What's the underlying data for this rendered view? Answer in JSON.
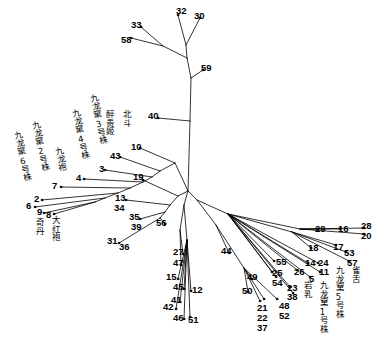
{
  "figure": {
    "type": "phylogenetic-tree",
    "layout": "unrooted-radial",
    "background_color": "#ffffff",
    "line_color": "#000000",
    "text_color": "#000000"
  },
  "chart_data": {
    "type": "scatter",
    "title": "",
    "xlabel": "",
    "ylabel": "",
    "grid": false,
    "legend": null,
    "tree_layout": "unrooted",
    "leaf_count": 59,
    "leaves": [
      {
        "id": "32",
        "label": "32",
        "x": 178,
        "y": 12
      },
      {
        "id": "30",
        "label": "30",
        "x": 201,
        "y": 15
      },
      {
        "id": "33",
        "label": "33",
        "x": 140,
        "y": 25
      },
      {
        "id": "58",
        "label": "58",
        "x": 130,
        "y": 39
      },
      {
        "id": "59",
        "label": "59",
        "x": 205,
        "y": 68
      },
      {
        "id": "40",
        "label": "40",
        "x": 155,
        "y": 116
      },
      {
        "id": "10",
        "label": "10",
        "x": 138,
        "y": 146,
        "name": "北斗"
      },
      {
        "id": "43",
        "label": "43",
        "x": 118,
        "y": 155,
        "name": "醉贵姬"
      },
      {
        "id": "3",
        "label": "3",
        "x": 103,
        "y": 168,
        "name": "九龙窠3号株"
      },
      {
        "id": "4",
        "label": "4",
        "x": 82,
        "y": 177,
        "name": "九龙窠4号株"
      },
      {
        "id": "7",
        "label": "7",
        "x": 59,
        "y": 185,
        "name": "九龙袍"
      },
      {
        "id": "2",
        "label": "2",
        "x": 40,
        "y": 198,
        "name": "九龙窠2号株"
      },
      {
        "id": "6",
        "label": "6",
        "x": 33,
        "y": 205,
        "name": "九龙窠6号株"
      },
      {
        "id": "9",
        "label": "9",
        "x": 42,
        "y": 212,
        "name": "奇丹"
      },
      {
        "id": "8",
        "label": "8",
        "x": 52,
        "y": 213,
        "name": "大红袍"
      },
      {
        "id": "19",
        "label": "19",
        "x": 140,
        "y": 177
      },
      {
        "id": "13",
        "label": "13",
        "x": 123,
        "y": 198
      },
      {
        "id": "34",
        "label": "34",
        "x": 122,
        "y": 208
      },
      {
        "id": "35",
        "label": "35",
        "x": 137,
        "y": 217
      },
      {
        "id": "39",
        "label": "39",
        "x": 138,
        "y": 227
      },
      {
        "id": "56",
        "label": "56",
        "x": 163,
        "y": 222
      },
      {
        "id": "31",
        "label": "31",
        "x": 115,
        "y": 241
      },
      {
        "id": "36",
        "label": "36",
        "x": 127,
        "y": 246
      },
      {
        "id": "27",
        "label": "27",
        "x": 180,
        "y": 252
      },
      {
        "id": "47",
        "label": "47",
        "x": 180,
        "y": 263
      },
      {
        "id": "15",
        "label": "15",
        "x": 173,
        "y": 277
      },
      {
        "id": "45",
        "label": "45",
        "x": 180,
        "y": 287
      },
      {
        "id": "12",
        "label": "12",
        "x": 199,
        "y": 289
      },
      {
        "id": "41",
        "label": "41",
        "x": 178,
        "y": 300
      },
      {
        "id": "42",
        "label": "42",
        "x": 170,
        "y": 307
      },
      {
        "id": "46",
        "label": "46",
        "x": 180,
        "y": 317
      },
      {
        "id": "51",
        "label": "51",
        "x": 194,
        "y": 319
      },
      {
        "id": "44",
        "label": "44",
        "x": 228,
        "y": 251
      },
      {
        "id": "49",
        "label": "49",
        "x": 254,
        "y": 277
      },
      {
        "id": "50",
        "label": "50",
        "x": 249,
        "y": 290
      },
      {
        "id": "21",
        "label": "21",
        "x": 264,
        "y": 307
      },
      {
        "id": "22",
        "label": "22",
        "x": 264,
        "y": 317
      },
      {
        "id": "37",
        "label": "37",
        "x": 264,
        "y": 327
      },
      {
        "id": "48",
        "label": "48",
        "x": 285,
        "y": 305
      },
      {
        "id": "52",
        "label": "52",
        "x": 285,
        "y": 315
      },
      {
        "id": "55",
        "label": "55",
        "x": 282,
        "y": 262
      },
      {
        "id": "25",
        "label": "25",
        "x": 278,
        "y": 273
      },
      {
        "id": "54",
        "label": "54",
        "x": 278,
        "y": 282
      },
      {
        "id": "23",
        "label": "23",
        "x": 293,
        "y": 287
      },
      {
        "id": "38",
        "label": "38",
        "x": 293,
        "y": 296
      },
      {
        "id": "26",
        "label": "26",
        "x": 300,
        "y": 271
      },
      {
        "id": "14",
        "label": "14",
        "x": 312,
        "y": 262
      },
      {
        "id": "24",
        "label": "24",
        "x": 325,
        "y": 262
      },
      {
        "id": "11",
        "label": "11",
        "x": 325,
        "y": 271
      },
      {
        "id": "5",
        "label": "5",
        "x": 313,
        "y": 278,
        "name": "九龙窠1号株"
      },
      {
        "id": "18",
        "label": "18",
        "x": 315,
        "y": 247
      },
      {
        "id": "17",
        "label": "17",
        "x": 340,
        "y": 246
      },
      {
        "id": "53",
        "label": "53",
        "x": 350,
        "y": 252
      },
      {
        "id": "57",
        "label": "57",
        "x": 353,
        "y": 262
      },
      {
        "id": "29",
        "label": "29",
        "x": 322,
        "y": 228
      },
      {
        "id": "16",
        "label": "16",
        "x": 344,
        "y": 228
      },
      {
        "id": "28",
        "label": "28",
        "x": 367,
        "y": 226
      },
      {
        "id": "20",
        "label": "20",
        "x": 367,
        "y": 235
      }
    ],
    "named_taxa": [
      {
        "number": "10",
        "name": "北斗"
      },
      {
        "number": "43",
        "name": "醉贵姬"
      },
      {
        "number": "3",
        "name": "九龙窠3号株"
      },
      {
        "number": "4",
        "name": "九龙窠4号株"
      },
      {
        "number": "7",
        "name": "九龙袍"
      },
      {
        "number": "2",
        "name": "九龙窠2号株"
      },
      {
        "number": "6",
        "name": "九龙窠6号株"
      },
      {
        "number": "9",
        "name": "奇丹"
      },
      {
        "number": "8",
        "name": "大红袍"
      },
      {
        "number": "5",
        "name": "九龙窠1号株"
      },
      {
        "number": "11",
        "name": "九龙窠5号株"
      },
      {
        "number": "24",
        "name": "雀舌"
      },
      {
        "number": "23",
        "name": "岩乳"
      }
    ]
  },
  "labels": {
    "numbers": [
      {
        "id": "n32",
        "text": "32",
        "x": 176,
        "y": 6
      },
      {
        "id": "n30",
        "text": "30",
        "x": 194,
        "y": 11
      },
      {
        "id": "n33",
        "text": "33",
        "x": 131,
        "y": 20
      },
      {
        "id": "n58",
        "text": "58",
        "x": 121,
        "y": 35
      },
      {
        "id": "n59",
        "text": "59",
        "x": 201,
        "y": 63
      },
      {
        "id": "n40",
        "text": "40",
        "x": 148,
        "y": 111
      },
      {
        "id": "n10",
        "text": "10",
        "x": 131,
        "y": 142
      },
      {
        "id": "n43",
        "text": "43",
        "x": 110,
        "y": 151
      },
      {
        "id": "n3",
        "text": "3",
        "x": 99,
        "y": 164
      },
      {
        "id": "n4",
        "text": "4",
        "x": 76,
        "y": 173
      },
      {
        "id": "n7",
        "text": "7",
        "x": 52,
        "y": 181
      },
      {
        "id": "n2",
        "text": "2",
        "x": 34,
        "y": 194
      },
      {
        "id": "n6",
        "text": "6",
        "x": 26,
        "y": 201
      },
      {
        "id": "n9",
        "text": "9",
        "x": 37,
        "y": 207
      },
      {
        "id": "n8",
        "text": "8",
        "x": 46,
        "y": 210
      },
      {
        "id": "n19",
        "text": "19",
        "x": 133,
        "y": 172
      },
      {
        "id": "n13",
        "text": "13",
        "x": 115,
        "y": 193
      },
      {
        "id": "n34",
        "text": "34",
        "x": 114,
        "y": 203
      },
      {
        "id": "n35",
        "text": "35",
        "x": 129,
        "y": 212
      },
      {
        "id": "n39",
        "text": "39",
        "x": 131,
        "y": 222
      },
      {
        "id": "n56",
        "text": "56",
        "x": 156,
        "y": 218
      },
      {
        "id": "n31",
        "text": "31",
        "x": 107,
        "y": 236
      },
      {
        "id": "n36",
        "text": "36",
        "x": 119,
        "y": 242
      },
      {
        "id": "n27",
        "text": "27",
        "x": 173,
        "y": 247
      },
      {
        "id": "n47",
        "text": "47",
        "x": 173,
        "y": 258
      },
      {
        "id": "n15",
        "text": "15",
        "x": 166,
        "y": 272
      },
      {
        "id": "n45",
        "text": "45",
        "x": 173,
        "y": 282
      },
      {
        "id": "n12",
        "text": "12",
        "x": 192,
        "y": 285
      },
      {
        "id": "n41",
        "text": "41",
        "x": 171,
        "y": 295
      },
      {
        "id": "n42",
        "text": "42",
        "x": 163,
        "y": 302
      },
      {
        "id": "n46",
        "text": "46",
        "x": 173,
        "y": 313
      },
      {
        "id": "n51",
        "text": "51",
        "x": 188,
        "y": 315
      },
      {
        "id": "n44",
        "text": "44",
        "x": 221,
        "y": 246
      },
      {
        "id": "n49",
        "text": "49",
        "x": 247,
        "y": 272
      },
      {
        "id": "n50",
        "text": "50",
        "x": 242,
        "y": 286
      },
      {
        "id": "n21",
        "text": "21",
        "x": 257,
        "y": 303
      },
      {
        "id": "n22",
        "text": "22",
        "x": 257,
        "y": 313
      },
      {
        "id": "n37",
        "text": "37",
        "x": 257,
        "y": 323
      },
      {
        "id": "n48",
        "text": "48",
        "x": 279,
        "y": 301
      },
      {
        "id": "n52",
        "text": "52",
        "x": 279,
        "y": 311
      },
      {
        "id": "n55",
        "text": "55",
        "x": 276,
        "y": 257
      },
      {
        "id": "n25",
        "text": "25",
        "x": 272,
        "y": 268
      },
      {
        "id": "n54",
        "text": "54",
        "x": 272,
        "y": 278
      },
      {
        "id": "n23",
        "text": "23",
        "x": 287,
        "y": 283
      },
      {
        "id": "n38",
        "text": "38",
        "x": 287,
        "y": 292
      },
      {
        "id": "n26",
        "text": "26",
        "x": 294,
        "y": 267
      },
      {
        "id": "n14",
        "text": "14",
        "x": 305,
        "y": 258
      },
      {
        "id": "n24",
        "text": "24",
        "x": 318,
        "y": 258
      },
      {
        "id": "n11",
        "text": "11",
        "x": 319,
        "y": 267
      },
      {
        "id": "n5",
        "text": "5",
        "x": 309,
        "y": 274
      },
      {
        "id": "n18",
        "text": "18",
        "x": 308,
        "y": 243
      },
      {
        "id": "n17",
        "text": "17",
        "x": 333,
        "y": 242
      },
      {
        "id": "n53",
        "text": "53",
        "x": 344,
        "y": 248
      },
      {
        "id": "n57",
        "text": "57",
        "x": 347,
        "y": 258
      },
      {
        "id": "n29",
        "text": "29",
        "x": 315,
        "y": 224
      },
      {
        "id": "n16",
        "text": "16",
        "x": 338,
        "y": 224
      },
      {
        "id": "n28",
        "text": "28",
        "x": 361,
        "y": 221
      },
      {
        "id": "n20",
        "text": "20",
        "x": 361,
        "y": 231
      }
    ],
    "chinese": [
      {
        "id": "c-beidou",
        "text": "北斗",
        "x": 121,
        "y": 110,
        "rot": 0
      },
      {
        "id": "c-zuiguiji",
        "text": "醉贵姬",
        "x": 104,
        "y": 110,
        "rot": 0
      },
      {
        "id": "c-jlk3",
        "text": "九龙窠3号株",
        "x": 88,
        "y": 95,
        "rot": -12
      },
      {
        "id": "c-jlk4",
        "text": "九龙窠4号株",
        "x": 70,
        "y": 110,
        "rot": -12
      },
      {
        "id": "c-jiulongpao",
        "text": "九龙袍",
        "x": 53,
        "y": 148,
        "rot": -12
      },
      {
        "id": "c-jlk2",
        "text": "九龙窠2号株",
        "x": 30,
        "y": 122,
        "rot": -12
      },
      {
        "id": "c-jlk6",
        "text": "九龙窠6号株",
        "x": 12,
        "y": 132,
        "rot": -12
      },
      {
        "id": "c-qidan",
        "text": "奇丹",
        "x": 34,
        "y": 218,
        "rot": 0
      },
      {
        "id": "c-dahongpao",
        "text": "大红袍",
        "x": 50,
        "y": 216,
        "rot": 0
      },
      {
        "id": "c-yanru",
        "text": "岩乳",
        "x": 302,
        "y": 281,
        "rot": 0
      },
      {
        "id": "c-jlk1",
        "text": "九龙窠1号株",
        "x": 318,
        "y": 281,
        "rot": 0
      },
      {
        "id": "c-jlk5",
        "text": "九龙窠5号株",
        "x": 334,
        "y": 266,
        "rot": 0
      },
      {
        "id": "c-queshe",
        "text": "雀舌",
        "x": 350,
        "y": 266,
        "rot": 0
      }
    ]
  }
}
